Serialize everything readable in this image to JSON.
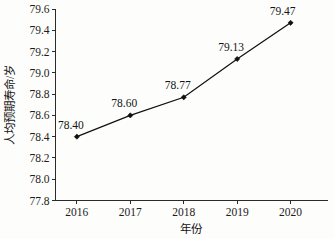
{
  "chart_data": {
    "type": "line",
    "title": "",
    "subtitle": "",
    "xlabel": "年份",
    "ylabel": "人均预期寿命/岁",
    "categories": [
      "2016",
      "2017",
      "2018",
      "2019",
      "2020"
    ],
    "x": [
      2016,
      2017,
      2018,
      2019,
      2020
    ],
    "values": [
      78.4,
      78.6,
      78.77,
      79.13,
      79.47
    ],
    "point_labels": [
      "78.40",
      "78.60",
      "78.77",
      "79.13",
      "79.47"
    ],
    "series": [
      {
        "name": "人均预期寿命",
        "values": [
          78.4,
          78.6,
          78.77,
          79.13,
          79.47
        ]
      }
    ],
    "ylim": [
      77.8,
      79.6
    ],
    "xlim": [
      2015.6,
      2020.7
    ],
    "ytick_labels": [
      "77.8",
      "78.0",
      "78.2",
      "78.4",
      "78.6",
      "78.8",
      "79.0",
      "79.2",
      "79.4",
      "79.6"
    ],
    "ytick_values": [
      77.8,
      78.0,
      78.2,
      78.4,
      78.6,
      78.8,
      79.0,
      79.2,
      79.4,
      79.6
    ],
    "xtick_labels": [
      "2016",
      "2017",
      "2018",
      "2019",
      "2020"
    ],
    "grid": false,
    "legend": false,
    "legend_position": "none",
    "marker": "diamond",
    "line_color": "#111111",
    "marker_color": "#111111",
    "background_color": "#fdfdfc",
    "axis_color": "#2b2b2b",
    "annotations": []
  },
  "axes": {
    "y_title": "人均预期寿命/岁",
    "x_title": "年份"
  }
}
